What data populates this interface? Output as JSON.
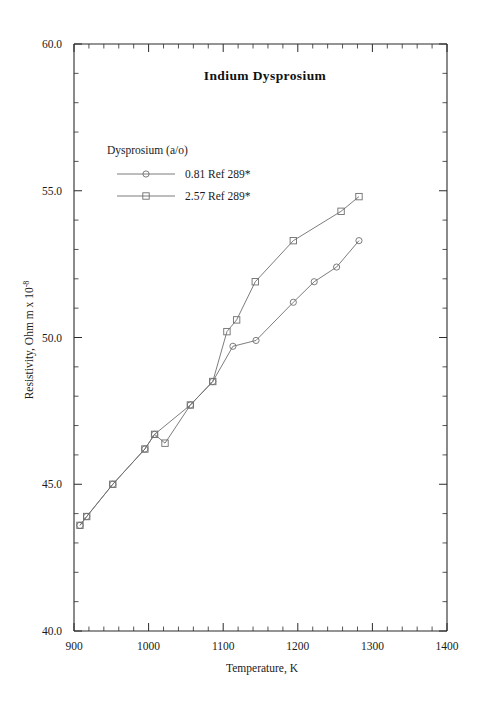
{
  "figure": {
    "title": "Indium  Dysprosium",
    "xlabel": "Temperature,  K",
    "ylabel_main": "Resistivity, Ohm m x 10",
    "ylabel_exp": "-8",
    "legend_title": "Dysprosium (a/o)",
    "legend": [
      {
        "label": "0.81 Ref 289*",
        "marker": "circle"
      },
      {
        "label": "2.57 Ref 289*",
        "marker": "square"
      }
    ],
    "xticklabels": [
      "900",
      "1000",
      "1100",
      "1200",
      "1300",
      "1400"
    ],
    "yticklabels": [
      "40.0",
      "45.0",
      "50.0",
      "55.0",
      "60.0"
    ]
  },
  "chart_data": {
    "type": "line",
    "title": "Indium  Dysprosium",
    "xlabel": "Temperature,  K",
    "ylabel": "Resistivity, Ohm m x 10^-8",
    "xlim": [
      900,
      1400
    ],
    "ylim": [
      40.0,
      60.0
    ],
    "xticks": [
      900,
      1000,
      1100,
      1200,
      1300,
      1400
    ],
    "yticks": [
      40.0,
      45.0,
      50.0,
      55.0,
      60.0
    ],
    "x_minor_step": 20,
    "y_minor_step": 1.0,
    "grid": false,
    "legend_position": "upper-left-inset",
    "legend_title": "Dysprosium (a/o)",
    "series": [
      {
        "name": "0.81 Ref 289*",
        "marker": "circle",
        "points": [
          [
            908,
            43.6
          ],
          [
            917,
            43.9
          ],
          [
            952,
            45.0
          ],
          [
            995,
            46.2
          ],
          [
            1008,
            46.7
          ],
          [
            1056,
            47.7
          ],
          [
            1086,
            48.5
          ],
          [
            1113,
            49.7
          ],
          [
            1144,
            49.9
          ],
          [
            1194,
            51.2
          ],
          [
            1222,
            51.9
          ],
          [
            1252,
            52.4
          ],
          [
            1282,
            53.3
          ]
        ]
      },
      {
        "name": "2.57 Ref 289*",
        "marker": "square",
        "points": [
          [
            908,
            43.6
          ],
          [
            917,
            43.9
          ],
          [
            952,
            45.0
          ],
          [
            995,
            46.2
          ],
          [
            1008,
            46.7
          ],
          [
            1022,
            46.4
          ],
          [
            1056,
            47.7
          ],
          [
            1086,
            48.5
          ],
          [
            1105,
            50.2
          ],
          [
            1118,
            50.6
          ],
          [
            1143,
            51.9
          ],
          [
            1194,
            53.3
          ],
          [
            1258,
            54.3
          ],
          [
            1282,
            54.8
          ]
        ]
      }
    ]
  }
}
